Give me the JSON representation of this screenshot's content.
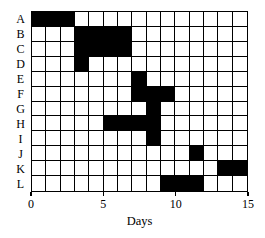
{
  "chart_data": {
    "type": "bar",
    "subtype": "gantt",
    "title": "",
    "subtitle": "",
    "xlabel": "Days",
    "ylabel": "",
    "xlim": [
      0,
      15
    ],
    "xticks": [
      0,
      5,
      10,
      15
    ],
    "xtick_labels": [
      "0",
      "5",
      "10",
      "15"
    ],
    "grid": true,
    "legend": null,
    "annotations": [],
    "categories": [
      "A",
      "B",
      "C",
      "D",
      "E",
      "F",
      "G",
      "H",
      "I",
      "J",
      "K",
      "L"
    ],
    "tasks": [
      {
        "label": "A",
        "start": 0,
        "end": 3,
        "duration": 3
      },
      {
        "label": "B",
        "start": 3,
        "end": 7,
        "duration": 4
      },
      {
        "label": "C",
        "start": 3,
        "end": 7,
        "duration": 4
      },
      {
        "label": "D",
        "start": 3,
        "end": 4,
        "duration": 1
      },
      {
        "label": "E",
        "start": 7,
        "end": 8,
        "duration": 1
      },
      {
        "label": "F",
        "start": 7,
        "end": 10,
        "duration": 3
      },
      {
        "label": "G",
        "start": 8,
        "end": 9,
        "duration": 1
      },
      {
        "label": "H",
        "start": 5,
        "end": 9,
        "duration": 4
      },
      {
        "label": "I",
        "start": 8,
        "end": 9,
        "duration": 1
      },
      {
        "label": "J",
        "start": 11,
        "end": 12,
        "duration": 1
      },
      {
        "label": "K",
        "start": 13,
        "end": 15,
        "duration": 2
      },
      {
        "label": "L",
        "start": 9,
        "end": 12,
        "duration": 3
      }
    ],
    "colors": {
      "bar": "#000000",
      "background": "#ffffff",
      "gridline": "#000000",
      "axis": "#000000"
    }
  }
}
